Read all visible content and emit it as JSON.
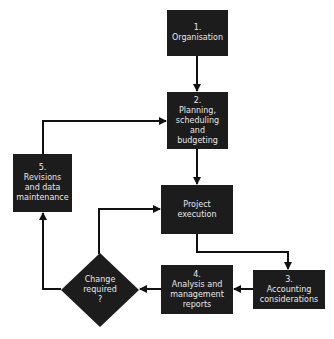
{
  "diagram": {
    "type": "flowchart",
    "colors": {
      "node_fill": "#1c1c1c",
      "node_text": "#e8e8e8",
      "edge": "#111111",
      "background": "#ffffff"
    },
    "nodes": {
      "organisation": {
        "number": "1.",
        "lines": [
          "Organisation"
        ]
      },
      "planning": {
        "number": "2.",
        "lines": [
          "Planning,",
          "scheduling",
          "and",
          "budgeting"
        ]
      },
      "execution": {
        "number": "",
        "lines": [
          "Project",
          "execution"
        ]
      },
      "accounting": {
        "number": "3.",
        "lines": [
          "Accounting",
          "considerations"
        ]
      },
      "analysis": {
        "number": "4.",
        "lines": [
          "Analysis and",
          "management",
          "reports"
        ]
      },
      "decision": {
        "lines": [
          "Change",
          "required",
          "?"
        ]
      },
      "revisions": {
        "number": "5.",
        "lines": [
          "Revisions",
          "and data",
          "maintenance"
        ]
      }
    },
    "edges": [
      {
        "from": "organisation",
        "to": "planning"
      },
      {
        "from": "planning",
        "to": "execution"
      },
      {
        "from": "execution",
        "to": "accounting"
      },
      {
        "from": "accounting",
        "to": "analysis"
      },
      {
        "from": "analysis",
        "to": "decision"
      },
      {
        "from": "decision",
        "to": "execution",
        "note": "from top of decision"
      },
      {
        "from": "decision",
        "to": "revisions",
        "note": "from left of decision"
      },
      {
        "from": "revisions",
        "to": "planning"
      }
    ]
  }
}
